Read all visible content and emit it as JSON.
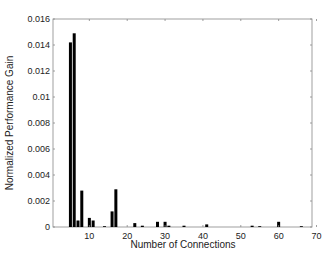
{
  "chart_data": {
    "type": "bar",
    "title": "",
    "xlabel": "Number of Connections",
    "ylabel": "Normalized Performance Gain",
    "xlim": [
      0,
      70
    ],
    "ylim": [
      0,
      0.016
    ],
    "grid": false,
    "legend": null,
    "xticks": [
      10,
      20,
      30,
      40,
      50,
      60,
      70
    ],
    "xtick_labels": [
      "10",
      "20",
      "30",
      "40",
      "50",
      "60",
      "70"
    ],
    "yticks": [
      0,
      0.002,
      0.004,
      0.006,
      0.008,
      0.01,
      0.012,
      0.014,
      0.016
    ],
    "ytick_labels": [
      "0",
      "0.002",
      "0.004",
      "0.006",
      "0.008",
      "0.01",
      "0.012",
      "0.014",
      "0.016"
    ],
    "bar_color": "#000000",
    "x": [
      5,
      6,
      7,
      8,
      10,
      11,
      14,
      16,
      17,
      22,
      24,
      28,
      30,
      31,
      35,
      41,
      53,
      55,
      60,
      66
    ],
    "values": [
      0.0142,
      0.0149,
      0.0005,
      0.0028,
      0.0007,
      0.0005,
      5e-05,
      0.0012,
      0.0029,
      0.0003,
      0.0001,
      0.0004,
      0.0004,
      0.0001,
      0.0001,
      0.0002,
      0.0001,
      5e-05,
      0.0004,
      5e-05
    ]
  }
}
